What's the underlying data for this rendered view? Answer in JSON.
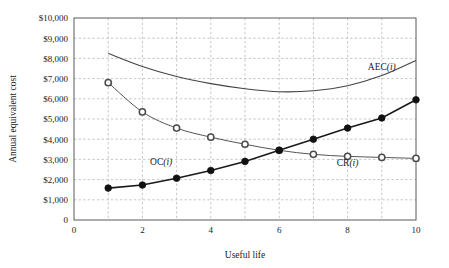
{
  "chart_data": {
    "type": "line",
    "title": "",
    "xlabel": "Useful life",
    "ylabel": "Annual equivalent cost",
    "xlim": [
      0,
      10
    ],
    "ylim": [
      0,
      10000
    ],
    "grid": true,
    "legend_position": "inline-annotations",
    "x_ticks": [
      0,
      2,
      4,
      6,
      8,
      10
    ],
    "x_tick_labels": [
      "0",
      "2",
      "4",
      "6",
      "8",
      "10"
    ],
    "x_minor_gridlines": [
      1,
      3,
      5,
      7,
      9
    ],
    "y_ticks": [
      0,
      1000,
      2000,
      3000,
      4000,
      5000,
      6000,
      7000,
      8000,
      9000,
      10000
    ],
    "y_tick_labels": [
      "0",
      "$1,000",
      "$2,000",
      "$3,000",
      "$4,000",
      "$5,000",
      "$6,000",
      "$7,000",
      "$8,000",
      "$9,000",
      "$10,000"
    ],
    "x": [
      1,
      2,
      3,
      4,
      5,
      6,
      7,
      8,
      9,
      10
    ],
    "series": [
      {
        "name": "AEC(i)",
        "label": "AEC",
        "label_suffix": "(i)",
        "marker": "none",
        "color": "#444444",
        "annotation_x": 9.0,
        "annotation_y": 7450,
        "values": [
          8250,
          7600,
          7100,
          6750,
          6500,
          6350,
          6400,
          6650,
          7150,
          7900
        ]
      },
      {
        "name": "CR(i)",
        "label": "CR",
        "label_suffix": "(i)",
        "marker": "open-circle",
        "color": "#555555",
        "annotation_x": 8.0,
        "annotation_y": 2650,
        "values": [
          6800,
          5350,
          4550,
          4100,
          3750,
          3450,
          3250,
          3150,
          3100,
          3050
        ]
      },
      {
        "name": "OC(i)",
        "label": "OC",
        "label_suffix": "(i)",
        "marker": "filled-circle",
        "color": "#1a1a1a",
        "annotation_x": 2.55,
        "annotation_y": 2700,
        "values": [
          1580,
          1730,
          2070,
          2450,
          2900,
          3450,
          4000,
          4550,
          5050,
          5950
        ]
      }
    ]
  }
}
